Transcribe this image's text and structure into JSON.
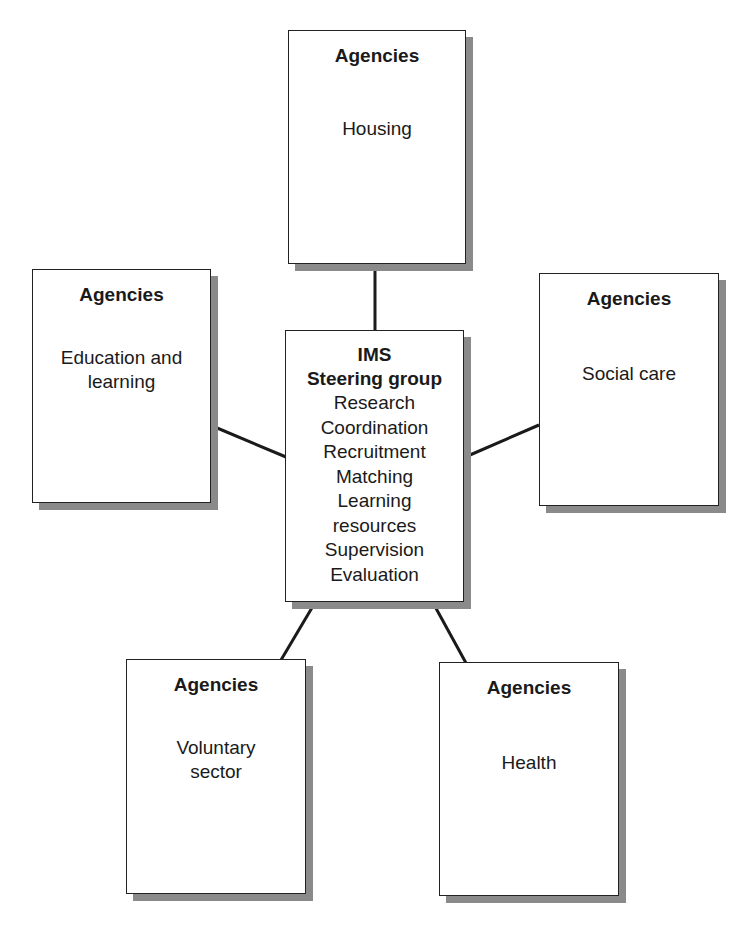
{
  "diagram": {
    "center": {
      "title_lines": [
        "IMS",
        "Steering group"
      ],
      "items": [
        "Research",
        "Coordination",
        "Recruitment",
        "Matching",
        "Learning",
        "resources",
        "Supervision",
        "Evaluation"
      ]
    },
    "nodes": [
      {
        "id": "top",
        "title": "Agencies",
        "label_lines": [
          "Housing"
        ]
      },
      {
        "id": "left",
        "title": "Agencies",
        "label_lines": [
          "Education and",
          "learning"
        ]
      },
      {
        "id": "right",
        "title": "Agencies",
        "label_lines": [
          "Social care"
        ]
      },
      {
        "id": "bottom-left",
        "title": "Agencies",
        "label_lines": [
          "Voluntary",
          "sector"
        ]
      },
      {
        "id": "bottom-right",
        "title": "Agencies",
        "label_lines": [
          "Health"
        ]
      }
    ],
    "colors": {
      "line": "#1a1a1a",
      "shadow": "#8a8a8a",
      "box_fill": "#ffffff"
    }
  }
}
